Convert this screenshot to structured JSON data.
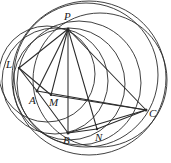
{
  "figure": {
    "name": "circle-geometry-diagram",
    "caption": "",
    "stroke_color": "#2b2b2b",
    "label_color": "#1a1a1a",
    "background_color": "#ffffff",
    "width": 171,
    "height": 163
  },
  "points": [
    {
      "id": "P",
      "label": "P",
      "x": 68,
      "y": 29,
      "label_x": 64,
      "label_y": 11
    },
    {
      "id": "L",
      "label": "L",
      "x": 19,
      "y": 68,
      "label_x": 6,
      "label_y": 59
    },
    {
      "id": "A",
      "label": "A",
      "x": 37,
      "y": 91,
      "label_x": 29,
      "label_y": 95
    },
    {
      "id": "M",
      "label": "M",
      "x": 51,
      "y": 95,
      "label_x": 49,
      "label_y": 97
    },
    {
      "id": "B",
      "label": "B",
      "x": 68,
      "y": 133,
      "label_x": 63,
      "label_y": 135
    },
    {
      "id": "N",
      "label": "N",
      "x": 97,
      "y": 129,
      "label_x": 95,
      "label_y": 132
    },
    {
      "id": "C",
      "label": "C",
      "x": 146,
      "y": 110,
      "label_x": 149,
      "label_y": 108
    }
  ],
  "segments": [
    {
      "id": "PA",
      "from": "P",
      "to": "A"
    },
    {
      "id": "PB",
      "from": "P",
      "to": "B"
    },
    {
      "id": "PC",
      "from": "P",
      "to": "C"
    },
    {
      "id": "PL",
      "from": "P",
      "to": "L"
    },
    {
      "id": "PM",
      "from": "P",
      "to": "M"
    },
    {
      "id": "PN",
      "from": "P",
      "to": "N"
    },
    {
      "id": "AB",
      "from": "A",
      "to": "B"
    },
    {
      "id": "AC",
      "from": "A",
      "to": "C"
    },
    {
      "id": "BC",
      "from": "B",
      "to": "C"
    },
    {
      "id": "LA",
      "from": "L",
      "to": "A"
    },
    {
      "id": "LM",
      "from": "L",
      "to": "M"
    },
    {
      "id": "BN",
      "from": "B",
      "to": "N"
    },
    {
      "id": "NC",
      "from": "N",
      "to": "C"
    },
    {
      "id": "MC",
      "from": "M",
      "to": "C"
    }
  ],
  "circles": [
    {
      "id": "circumcircle-ABC",
      "cx": 89,
      "cy": 78,
      "r": 77
    },
    {
      "id": "circle-through-P-A-B",
      "cx": 55,
      "cy": 81,
      "r": 53
    },
    {
      "id": "circle-through-P-L-A",
      "cx": 47,
      "cy": 74,
      "r": 48
    },
    {
      "id": "circle-through-P-B-N",
      "cx": 79,
      "cy": 83,
      "r": 62
    },
    {
      "id": "circle-through-P-M-B",
      "cx": 69,
      "cy": 84,
      "r": 56
    },
    {
      "id": "circle-through-P-N-C",
      "cx": 100,
      "cy": 80,
      "r": 67
    },
    {
      "id": "circle-through-A-B-C",
      "cx": 86,
      "cy": 75,
      "r": 72
    }
  ]
}
